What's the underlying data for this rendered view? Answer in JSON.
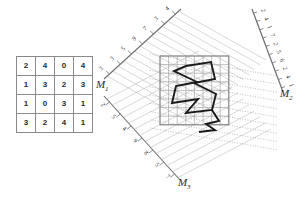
{
  "figure": {
    "colors": {
      "grid_line": "#9a9a9a",
      "ray_line": "#b0b0b0",
      "axis_line": "#6e6e6e",
      "shape_stroke": "#1a1a1a",
      "text": "#2b2b2b",
      "background": "#ffffff"
    }
  },
  "matrix": {
    "name": "pixel-value-matrix",
    "rows": 4,
    "cols": 4,
    "values": [
      [
        2,
        4,
        0,
        4
      ],
      [
        1,
        3,
        2,
        3
      ],
      [
        1,
        0,
        3,
        1
      ],
      [
        3,
        2,
        4,
        1
      ]
    ]
  },
  "axes": [
    {
      "id": "M1",
      "label": "M",
      "subscript": "1",
      "position": "upper-left",
      "bin_values": [
        3,
        3,
        5,
        9,
        7,
        3,
        4
      ]
    },
    {
      "id": "M2",
      "label": "M",
      "subscript": "2",
      "position": "right",
      "bin_values": [
        2,
        4,
        1,
        7,
        2,
        5,
        6,
        2,
        4,
        1
      ]
    },
    {
      "id": "M3",
      "label": "M",
      "subscript": "3",
      "position": "lower-left",
      "bin_values": [
        2,
        5,
        4,
        9,
        8,
        5,
        7
      ]
    }
  ],
  "grid": {
    "name": "sample-grid",
    "rows": 8,
    "cols": 8
  },
  "shape": {
    "name": "zigzag-region",
    "description": "thick closed zigzag polyline over the sample grid"
  }
}
